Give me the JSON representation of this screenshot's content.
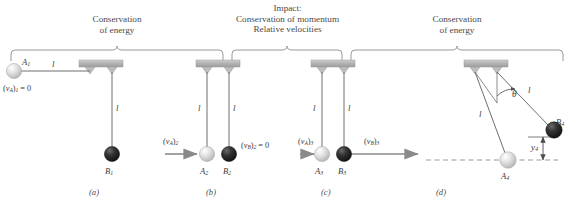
{
  "figure": {
    "type": "physics-diagram",
    "panels": [
      "(a)",
      "(b)",
      "(c)",
      "(d)"
    ]
  },
  "headers": [
    {
      "id": "left",
      "line1": "Conservation",
      "line2": "of energy",
      "line3": ""
    },
    {
      "id": "center",
      "line1": "Impact:",
      "line2": "Conservation of momentum",
      "line3": "Relative velocities"
    },
    {
      "id": "right",
      "line1": "Conservation",
      "line2": "of energy",
      "line3": ""
    }
  ],
  "panel_a": {
    "caption": "(a)",
    "ball_A_label": "A",
    "ball_A_sub": "1",
    "ball_B_label": "B",
    "ball_B_sub": "1",
    "cord_horizontal": "l",
    "cord_vertical": "l",
    "velocity_A_prefix": "(",
    "velocity_A_sym": "v",
    "velocity_A_sub_inner": "A",
    "velocity_A_suffix": ")",
    "velocity_A_sub_outer": "1",
    "velocity_A_value": "= 0"
  },
  "panel_b": {
    "caption": "(b)",
    "ball_A_label": "A",
    "ball_A_sub": "2",
    "ball_B_label": "B",
    "ball_B_sub": "2",
    "cord_left": "l",
    "cord_right": "l",
    "velocity_A_sym": "v",
    "velocity_A_sub_inner": "A",
    "velocity_A_sub_outer": "2",
    "velocity_B_sym": "v",
    "velocity_B_sub_inner": "B",
    "velocity_B_sub_outer": "2",
    "velocity_B_value": "= 0"
  },
  "panel_c": {
    "caption": "(c)",
    "ball_A_label": "A",
    "ball_A_sub": "3",
    "ball_B_label": "B",
    "ball_B_sub": "3",
    "cord_left": "l",
    "cord_right": "l",
    "velocity_A_sym": "v",
    "velocity_A_sub_inner": "A",
    "velocity_A_sub_outer": "3",
    "velocity_B_sym": "v",
    "velocity_B_sub_inner": "B",
    "velocity_B_sub_outer": "3"
  },
  "panel_d": {
    "caption": "(d)",
    "ball_A_label": "A",
    "ball_A_sub": "4",
    "ball_B_label": "B",
    "ball_B_sub": "4",
    "cord_left": "l",
    "cord_right": "l",
    "angle_label": "θ",
    "height_label": "y",
    "height_sub": "4"
  },
  "colors": {
    "ball_light": "#d8d8d8",
    "ball_dark": "#2b2b2b",
    "support_bar": "#b9b9b9",
    "line": "#6e6e6e",
    "arrow": "#8a8a8a",
    "text": "#3a3a3a",
    "background": "#ffffff"
  }
}
